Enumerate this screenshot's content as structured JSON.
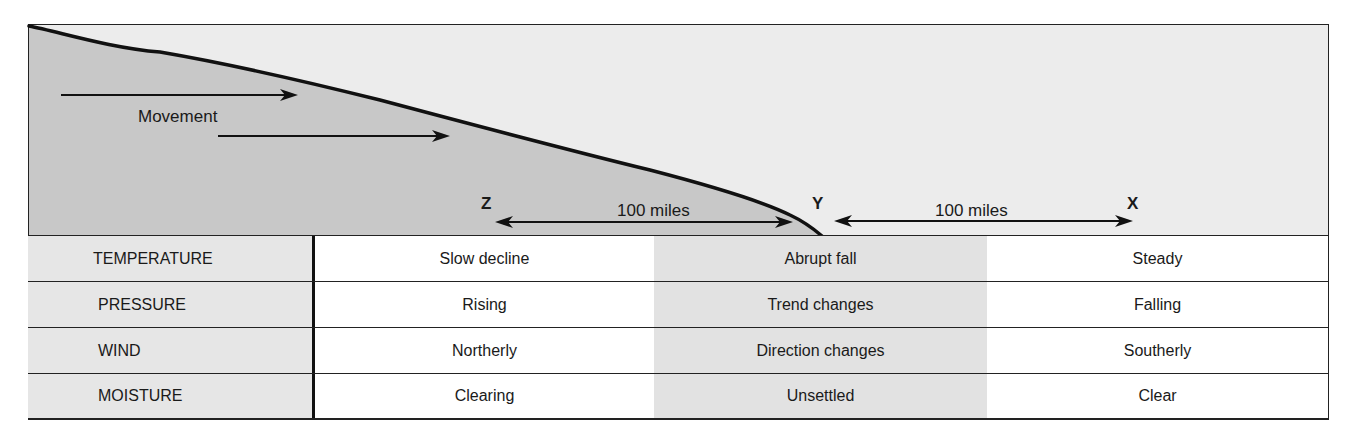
{
  "diagram": {
    "movement_label": "Movement",
    "points": {
      "z": "Z",
      "y": "Y",
      "x": "X"
    },
    "distances": {
      "z_to_y": "100 miles",
      "y_to_x": "100 miles"
    },
    "colors": {
      "cold_air_fill": "#c8c8c8",
      "warm_air_fill": "#ececec",
      "line": "#111111",
      "band": "#e2e2e2"
    }
  },
  "table": {
    "rows": [
      {
        "label": "TEMPERATURE",
        "z_side": "Slow decline",
        "at_front": "Abrupt fall",
        "x_side": "Steady"
      },
      {
        "label": "PRESSURE",
        "z_side": "Rising",
        "at_front": "Trend changes",
        "x_side": "Falling"
      },
      {
        "label": "WIND",
        "z_side": "Northerly",
        "at_front": "Direction changes",
        "x_side": "Southerly"
      },
      {
        "label": "MOISTURE",
        "z_side": "Clearing",
        "at_front": "Unsettled",
        "x_side": "Clear"
      }
    ]
  }
}
